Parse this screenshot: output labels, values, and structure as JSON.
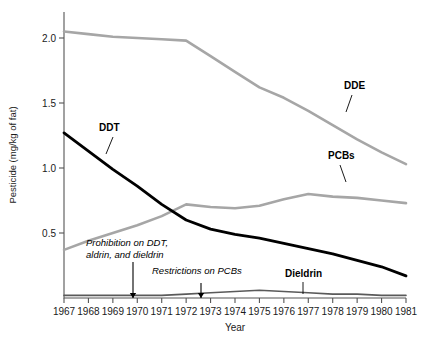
{
  "chart_data": {
    "type": "line",
    "title": "",
    "xlabel": "Year",
    "ylabel": "Pesticide (mg/kg of fat)",
    "x": [
      1967,
      1968,
      1969,
      1970,
      1971,
      1972,
      1973,
      1974,
      1975,
      1976,
      1977,
      1978,
      1979,
      1980,
      1981
    ],
    "xlim": [
      1967,
      1981
    ],
    "ylim": [
      0,
      2.2
    ],
    "yticks": [
      0.5,
      1.0,
      1.5,
      2.0
    ],
    "ytick_labels": [
      "0.5",
      "1.0",
      "1.5",
      "2.0"
    ],
    "xtick_labels": [
      "1967",
      "1968",
      "1969",
      "1970",
      "1971",
      "1972",
      "1973",
      "1974",
      "1975",
      "1976",
      "1977",
      "1978",
      "1979",
      "1980",
      "1981"
    ],
    "grid": false,
    "legend": "inline-labels",
    "series": [
      {
        "name": "DDE",
        "color": "#a6a6a6",
        "width": 2.6,
        "values": [
          2.05,
          2.03,
          2.01,
          2.0,
          1.99,
          1.98,
          1.86,
          1.74,
          1.62,
          1.54,
          1.44,
          1.33,
          1.22,
          1.12,
          1.03
        ]
      },
      {
        "name": "PCBs",
        "color": "#a6a6a6",
        "width": 2.6,
        "values": [
          0.37,
          0.44,
          0.5,
          0.56,
          0.63,
          0.72,
          0.7,
          0.69,
          0.71,
          0.76,
          0.8,
          0.78,
          0.77,
          0.75,
          0.73
        ]
      },
      {
        "name": "DDT",
        "color": "#000000",
        "width": 2.8,
        "values": [
          1.27,
          1.13,
          0.99,
          0.86,
          0.72,
          0.6,
          0.53,
          0.49,
          0.46,
          0.42,
          0.38,
          0.34,
          0.29,
          0.24,
          0.17
        ]
      },
      {
        "name": "Dieldrin",
        "color": "#5a5a5a",
        "width": 1.6,
        "values": [
          0.02,
          0.02,
          0.02,
          0.02,
          0.02,
          0.03,
          0.04,
          0.05,
          0.06,
          0.05,
          0.04,
          0.03,
          0.03,
          0.02,
          0.02
        ]
      }
    ],
    "series_labels": [
      {
        "name": "DDE",
        "text": "DDE",
        "x": 344,
        "y": 89,
        "lx": 352,
        "ly": 95,
        "lx2": 346,
        "ly2": 112
      },
      {
        "name": "PCBs",
        "text": "PCBs",
        "x": 328,
        "y": 159,
        "lx": 340,
        "ly": 165,
        "lx2": 346,
        "ly2": 182
      },
      {
        "name": "DDT",
        "text": "DDT",
        "x": 99,
        "y": 131,
        "lx": 113,
        "ly": 137,
        "lx2": 106,
        "ly2": 154
      },
      {
        "name": "Dieldrin",
        "text": "Dieldrin",
        "x": 285,
        "y": 277,
        "lx": 303,
        "ly": 282,
        "lx2": 303,
        "ly2": 294
      }
    ],
    "annotations": [
      {
        "id": "prohibition-ddt",
        "lines": [
          "Prohibition on DDT,",
          "aldrin, and dieldrin"
        ],
        "x": 86,
        "y": 246,
        "arrow_x": 133,
        "arrow_y1": 262,
        "arrow_y2": 298
      },
      {
        "id": "restrictions-pcbs",
        "lines": [
          "Restrictions on PCBs"
        ],
        "x": 152,
        "y": 274,
        "arrow_x": 201,
        "arrow_y1": 283,
        "arrow_y2": 298
      }
    ]
  }
}
